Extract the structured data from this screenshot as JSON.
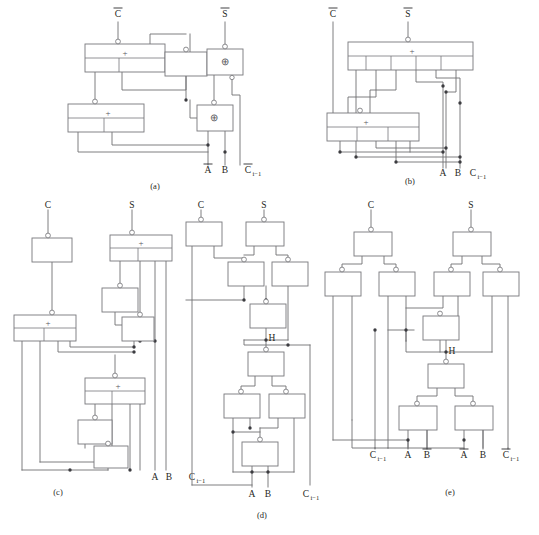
{
  "figure": {
    "panel_count": 5,
    "captions": [
      "(a)",
      "(b)",
      "(c)",
      "(d)",
      "(e)"
    ],
    "operators": {
      "or_plus": "+",
      "xor": "⊕",
      "internal_node": "H"
    },
    "colors": {
      "background": "#ffffff",
      "wire": "#6f6f73",
      "gate_outline": "#77777b",
      "junction": "#3c3c40",
      "text": "#1f1f22"
    }
  },
  "panels": [
    {
      "id": "a",
      "caption": "(a)",
      "caption_x": 155,
      "caption_y": 186,
      "top_labels": [
        {
          "text": "C",
          "overbar": true,
          "x": 118,
          "y": 14
        },
        {
          "text": "S",
          "overbar": true,
          "x": 225,
          "y": 14
        }
      ],
      "bottom_labels": [
        {
          "text": "A",
          "overbar": true,
          "sub": "",
          "x": 208,
          "y": 170
        },
        {
          "text": "B",
          "overbar": false,
          "sub": "",
          "x": 223,
          "y": 170
        },
        {
          "text": "C",
          "overbar": true,
          "sub": "i−1",
          "x": 250,
          "y": 170
        }
      ],
      "gates": [
        {
          "name": "or-gate-1",
          "op": "+",
          "x": 85,
          "y": 44,
          "w": 80,
          "h": 28,
          "bubble": true,
          "divider": true
        },
        {
          "name": "buffer-1",
          "op": "",
          "x": 165,
          "y": 52,
          "w": 42,
          "h": 24,
          "bubble": true,
          "divider": false
        },
        {
          "name": "xor-gate-1",
          "op": "⊕",
          "x": 207,
          "y": 49,
          "w": 36,
          "h": 26,
          "bubble": true,
          "divider": false
        },
        {
          "name": "or-gate-2",
          "op": "+",
          "x": 68,
          "y": 104,
          "w": 76,
          "h": 28,
          "bubble": true,
          "divider": true
        },
        {
          "name": "xor-gate-2",
          "op": "⊕",
          "x": 197,
          "y": 105,
          "w": 36,
          "h": 26,
          "bubble": true,
          "divider": false
        }
      ]
    },
    {
      "id": "b",
      "caption": "(b)",
      "caption_x": 410,
      "caption_y": 182,
      "top_labels": [
        {
          "text": "C",
          "overbar": true,
          "x": 333,
          "y": 14
        },
        {
          "text": "S",
          "overbar": true,
          "x": 408,
          "y": 14
        }
      ],
      "bottom_labels": [
        {
          "text": "A",
          "overbar": false,
          "sub": "",
          "x": 447,
          "y": 172
        },
        {
          "text": "B",
          "overbar": false,
          "sub": "",
          "x": 461,
          "y": 172
        },
        {
          "text": "C",
          "overbar": false,
          "sub": "i−1",
          "x": 477,
          "y": 172
        }
      ],
      "gates": [
        {
          "name": "or-gate-wide-1",
          "op": "+",
          "x": 348,
          "y": 42,
          "w": 125,
          "h": 28,
          "bubble": true,
          "divider": true
        },
        {
          "name": "or-gate-wide-2",
          "op": "+",
          "x": 327,
          "y": 113,
          "w": 92,
          "h": 28,
          "bubble": true,
          "divider": true
        }
      ]
    },
    {
      "id": "c",
      "caption": "(c)",
      "caption_x": 58,
      "caption_y": 492,
      "top_labels": [
        {
          "text": "C",
          "overbar": false,
          "x": 48,
          "y": 204
        },
        {
          "text": "S",
          "overbar": false,
          "x": 132,
          "y": 204
        }
      ],
      "bottom_labels": [
        {
          "text": "A",
          "overbar": false,
          "sub": "",
          "x": 126,
          "y": 478
        },
        {
          "text": "B",
          "overbar": false,
          "sub": "",
          "x": 139,
          "y": 478
        },
        {
          "text": "C",
          "overbar": false,
          "sub": "i−1",
          "x": 166,
          "y": 478
        }
      ],
      "gates": [
        {
          "name": "buffer-c1",
          "op": "",
          "x": 32,
          "y": 238,
          "w": 40,
          "h": 24,
          "bubble": true,
          "divider": false
        },
        {
          "name": "or-gate-c1",
          "op": "+",
          "x": 110,
          "y": 235,
          "w": 62,
          "h": 26,
          "bubble": true,
          "divider": true
        },
        {
          "name": "buffer-c2",
          "op": "",
          "x": 100,
          "y": 288,
          "w": 30,
          "h": 24,
          "bubble": false,
          "divider": false
        },
        {
          "name": "buffer-c3",
          "op": "",
          "x": 120,
          "y": 315,
          "w": 28,
          "h": 26,
          "bubble": true,
          "divider": false
        },
        {
          "name": "or-gate-c2",
          "op": "+",
          "x": 14,
          "y": 315,
          "w": 62,
          "h": 26,
          "bubble": true,
          "divider": true
        },
        {
          "name": "or-gate-c3",
          "op": "+",
          "x": 85,
          "y": 378,
          "w": 60,
          "h": 26,
          "bubble": true,
          "divider": true
        },
        {
          "name": "buffer-c4",
          "op": "",
          "x": 75,
          "y": 420,
          "w": 28,
          "h": 24,
          "bubble": true,
          "divider": false
        },
        {
          "name": "buffer-c5",
          "op": "",
          "x": 94,
          "y": 448,
          "w": 28,
          "h": 22,
          "bubble": true,
          "divider": false
        }
      ]
    },
    {
      "id": "d",
      "caption": "(d)",
      "caption_x": 262,
      "caption_y": 516,
      "top_labels": [
        {
          "text": "C",
          "overbar": false,
          "x": 201,
          "y": 204
        },
        {
          "text": "S",
          "overbar": false,
          "x": 264,
          "y": 204
        }
      ],
      "bottom_labels": [
        {
          "text": "A",
          "overbar": false,
          "sub": "",
          "x": 245,
          "y": 495
        },
        {
          "text": "B",
          "overbar": false,
          "sub": "",
          "x": 272,
          "y": 495
        },
        {
          "text": "C",
          "overbar": false,
          "sub": "i−1",
          "x": 309,
          "y": 495
        }
      ],
      "node_labels": [
        {
          "text": "H",
          "x": 265,
          "y": 337
        }
      ],
      "gates": [
        {
          "name": "nand-d1",
          "op": "",
          "x": 186,
          "y": 222,
          "w": 36,
          "h": 24,
          "bubble": true,
          "divider": false
        },
        {
          "name": "nand-d2",
          "op": "",
          "x": 248,
          "y": 222,
          "w": 36,
          "h": 24,
          "bubble": true,
          "divider": false
        },
        {
          "name": "nand-d3",
          "op": "",
          "x": 227,
          "y": 262,
          "w": 34,
          "h": 24,
          "bubble": true,
          "divider": false
        },
        {
          "name": "nand-d4",
          "op": "",
          "x": 271,
          "y": 262,
          "w": 34,
          "h": 24,
          "bubble": true,
          "divider": false
        },
        {
          "name": "nand-d5",
          "op": "",
          "x": 249,
          "y": 304,
          "w": 34,
          "h": 24,
          "bubble": true,
          "divider": false
        },
        {
          "name": "nand-d6",
          "op": "",
          "x": 246,
          "y": 352,
          "w": 34,
          "h": 24,
          "bubble": true,
          "divider": false
        },
        {
          "name": "nand-d7",
          "op": "",
          "x": 224,
          "y": 394,
          "w": 34,
          "h": 24,
          "bubble": true,
          "divider": false
        },
        {
          "name": "nand-d8",
          "op": "",
          "x": 269,
          "y": 394,
          "w": 34,
          "h": 24,
          "bubble": true,
          "divider": false
        },
        {
          "name": "nand-d9",
          "op": "",
          "x": 243,
          "y": 442,
          "w": 34,
          "h": 24,
          "bubble": true,
          "divider": false
        }
      ]
    },
    {
      "id": "e",
      "caption": "(e)",
      "caption_x": 450,
      "caption_y": 492,
      "top_labels": [
        {
          "text": "C",
          "overbar": false,
          "x": 371,
          "y": 204
        },
        {
          "text": "S",
          "overbar": false,
          "x": 471,
          "y": 204
        }
      ],
      "bottom_labels": [
        {
          "text": "C",
          "overbar": false,
          "sub": "i−1",
          "x": 375,
          "y": 455
        },
        {
          "text": "A",
          "overbar": false,
          "sub": "",
          "x": 405,
          "y": 455
        },
        {
          "text": "B",
          "overbar": true,
          "sub": "",
          "x": 422,
          "y": 455
        },
        {
          "text": "A",
          "overbar": true,
          "sub": "",
          "x": 452,
          "y": 455
        },
        {
          "text": "B",
          "overbar": false,
          "sub": "",
          "x": 473,
          "y": 455
        },
        {
          "text": "C",
          "overbar": true,
          "sub": "i−1",
          "x": 506,
          "y": 455
        }
      ],
      "node_labels": [
        {
          "text": "H",
          "x": 448,
          "y": 352
        }
      ],
      "gates": [
        {
          "name": "nand-e1",
          "op": "",
          "x": 355,
          "y": 232,
          "w": 38,
          "h": 24,
          "bubble": true,
          "divider": false
        },
        {
          "name": "nand-e2",
          "op": "",
          "x": 461,
          "y": 232,
          "w": 38,
          "h": 24,
          "bubble": true,
          "divider": false
        },
        {
          "name": "nand-e3",
          "op": "",
          "x": 325,
          "y": 272,
          "w": 34,
          "h": 24,
          "bubble": true,
          "divider": false
        },
        {
          "name": "nand-e4",
          "op": "",
          "x": 379,
          "y": 272,
          "w": 34,
          "h": 24,
          "bubble": true,
          "divider": false
        },
        {
          "name": "nand-e5",
          "op": "",
          "x": 434,
          "y": 272,
          "w": 34,
          "h": 24,
          "bubble": true,
          "divider": false
        },
        {
          "name": "nand-e6",
          "op": "",
          "x": 483,
          "y": 272,
          "w": 34,
          "h": 24,
          "bubble": true,
          "divider": false
        },
        {
          "name": "nand-e7",
          "op": "",
          "x": 429,
          "y": 316,
          "w": 34,
          "h": 24,
          "bubble": true,
          "divider": false
        },
        {
          "name": "nand-e8",
          "op": "",
          "x": 429,
          "y": 364,
          "w": 34,
          "h": 24,
          "bubble": true,
          "divider": false
        },
        {
          "name": "nand-e9",
          "op": "",
          "x": 399,
          "y": 406,
          "w": 36,
          "h": 24,
          "bubble": true,
          "divider": false
        },
        {
          "name": "nand-e10",
          "op": "",
          "x": 455,
          "y": 406,
          "w": 36,
          "h": 24,
          "bubble": true,
          "divider": false
        }
      ]
    }
  ]
}
